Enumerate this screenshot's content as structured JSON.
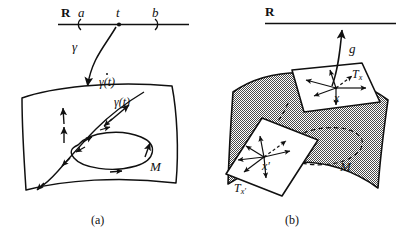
{
  "figure": {
    "type": "mathematical-diagram",
    "background_color": "#ffffff",
    "ink_color": "#101010",
    "surface_fill_a": "#ffffff",
    "surface_fill_b": "#b9b9b9",
    "panels": [
      {
        "id": "a",
        "caption": "(a)",
        "real_line": {
          "axis_label": "R",
          "tick_labels": [
            "a",
            "t",
            "b"
          ],
          "markers": [
            "(",
            "•",
            ")"
          ]
        },
        "map_label": "γ",
        "point_label": "γ(t)",
        "velocity_label": "γ(t)",
        "velocity_accent": "dot",
        "manifold_label": "M"
      },
      {
        "id": "b",
        "caption": "(b)",
        "real_line": {
          "axis_label": "R"
        },
        "function_label": "g",
        "tangent_space_upper": {
          "space": "T",
          "subscript": "x",
          "point": "x"
        },
        "tangent_space_lower": {
          "space": "T",
          "subscript": "x′",
          "point": "x′"
        },
        "manifold_label": "M"
      }
    ]
  }
}
